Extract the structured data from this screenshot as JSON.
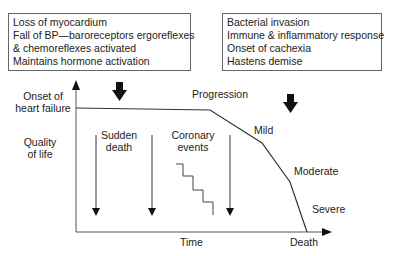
{
  "left_box": {
    "lines": [
      "Loss of myocardium",
      "Fall of BP—baroreceptors ergoreflexes",
      "& chemoreflexes activated",
      "Maintains hormone activation"
    ]
  },
  "right_box": {
    "lines": [
      "Bacterial invasion",
      "Immune & inflammatory response",
      "Onset of cachexia",
      "Hastens demise"
    ]
  },
  "labels": {
    "onset_line1": "Onset of",
    "onset_line2": "heart failure",
    "quality_line1": "Quality",
    "quality_line2": "of life",
    "sudden_line1": "Sudden",
    "sudden_line2": "death",
    "coronary_line1": "Coronary",
    "coronary_line2": "events",
    "progression": "Progression",
    "mild": "Mild",
    "moderate": "Moderate",
    "severe": "Severe",
    "time": "Time",
    "death": "Death"
  },
  "colors": {
    "line": "#333333",
    "box_border": "#666666"
  }
}
